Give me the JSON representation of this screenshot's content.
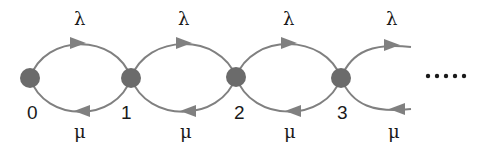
{
  "diagram": {
    "colors": {
      "node": "#6b6b6b",
      "edge": "#808080",
      "text": "#1a1a1a"
    },
    "states": [
      {
        "id": "0",
        "label": "0",
        "x": 30,
        "y": 78
      },
      {
        "id": "1",
        "label": "1",
        "x": 131,
        "y": 78
      },
      {
        "id": "2",
        "label": "2",
        "x": 236,
        "y": 77
      },
      {
        "id": "3",
        "label": "3",
        "x": 341,
        "y": 78
      }
    ],
    "transitions": [
      {
        "from": "0",
        "to": "1",
        "rate": "λ",
        "direction": "forward"
      },
      {
        "from": "1",
        "to": "0",
        "rate": "μ",
        "direction": "backward"
      },
      {
        "from": "1",
        "to": "2",
        "rate": "λ",
        "direction": "forward"
      },
      {
        "from": "2",
        "to": "1",
        "rate": "μ",
        "direction": "backward"
      },
      {
        "from": "2",
        "to": "3",
        "rate": "λ",
        "direction": "forward"
      },
      {
        "from": "3",
        "to": "2",
        "rate": "μ",
        "direction": "backward"
      },
      {
        "from": "3",
        "to": "…",
        "rate": "λ",
        "direction": "forward"
      },
      {
        "from": "…",
        "to": "3",
        "rate": "μ",
        "direction": "backward"
      }
    ],
    "labels": {
      "lambda": "λ",
      "mu": "μ",
      "continuation": "....."
    }
  }
}
